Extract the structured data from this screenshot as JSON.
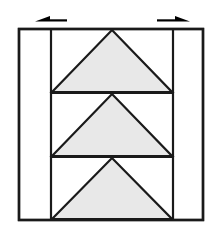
{
  "figure": {
    "title": "",
    "background_color": "#ffffff",
    "width": 216,
    "height": 235
  },
  "style": {
    "stroke_color": "#1a1a1a",
    "triangle_fill": "#e8e8e8",
    "panel_fill": "#ffffff",
    "outer_stroke_width": 2.4,
    "inner_stroke_width": 2.2,
    "triangle_stroke_width": 2.2,
    "arrow_color": "#000000"
  },
  "outer_frame": {
    "name": "outer-rectangle",
    "x": 19,
    "y": 29,
    "width": 184,
    "height": 191,
    "right": 203,
    "bottom": 220
  },
  "inner_lines": {
    "left_vertical": {
      "name": "left-vertical-divider",
      "x": 51,
      "y_top": 29,
      "y_bottom": 220
    },
    "right_vertical": {
      "name": "right-vertical-divider",
      "x": 173,
      "y_top": 29,
      "y_bottom": 220
    },
    "upper_horizontal": {
      "name": "upper-horizontal-divider",
      "y": 93,
      "x_left": 51,
      "x_right": 173
    },
    "lower_horizontal": {
      "name": "lower-horizontal-divider",
      "y": 157,
      "x_left": 51,
      "x_right": 173
    }
  },
  "triangles": [
    {
      "name": "triangle-top",
      "apex": {
        "x": 112,
        "y": 30
      },
      "base_left": {
        "x": 52,
        "y": 92
      },
      "base_right": {
        "x": 172,
        "y": 92
      },
      "fill": "#e8e8e8",
      "orientation": "apex-up"
    },
    {
      "name": "triangle-middle",
      "apex": {
        "x": 112,
        "y": 94
      },
      "base_left": {
        "x": 52,
        "y": 156
      },
      "base_right": {
        "x": 172,
        "y": 156
      },
      "fill": "#e8e8e8",
      "orientation": "apex-up"
    },
    {
      "name": "triangle-bottom",
      "apex": {
        "x": 112,
        "y": 158
      },
      "base_left": {
        "x": 52,
        "y": 219
      },
      "base_right": {
        "x": 172,
        "y": 219
      },
      "fill": "#e8e8e8",
      "orientation": "apex-up"
    }
  ],
  "arrows": [
    {
      "name": "arrow-left",
      "direction": "left",
      "tail_x": 67,
      "head_x": 35,
      "y": 18,
      "label": ""
    },
    {
      "name": "arrow-right",
      "direction": "right",
      "tail_x": 157,
      "head_x": 190,
      "y": 18,
      "label": ""
    }
  ],
  "panels": [
    {
      "name": "left-side-panel",
      "x": 19,
      "y": 29,
      "width": 32,
      "height": 191
    },
    {
      "name": "right-side-panel",
      "x": 173,
      "y": 29,
      "width": 30,
      "height": 191
    }
  ]
}
